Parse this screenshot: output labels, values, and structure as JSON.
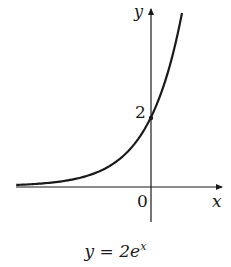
{
  "chart_data": {
    "type": "line",
    "title": "",
    "caption": "y = 2e^x",
    "function": "y = 2e^x",
    "xlabel": "x",
    "ylabel": "y",
    "origin_label": "0",
    "y_tick_labels": [
      "2"
    ],
    "annotations": [
      {
        "point": [
          0,
          2
        ],
        "label": "2",
        "marker": "dot"
      }
    ],
    "xlim": [
      -4.0,
      2.1
    ],
    "ylim": [
      -1.0,
      5.2
    ],
    "grid": false,
    "legend": null,
    "series": [
      {
        "name": "y = 2e^x",
        "x": [
          -4.0,
          -3.5,
          -3.0,
          -2.5,
          -2.0,
          -1.5,
          -1.0,
          -0.5,
          0.0,
          0.25,
          0.5,
          0.75,
          0.92
        ],
        "values": [
          0.04,
          0.06,
          0.1,
          0.16,
          0.27,
          0.45,
          0.74,
          1.21,
          2.0,
          2.57,
          3.3,
          4.23,
          5.02
        ]
      }
    ]
  },
  "labels": {
    "y_axis": "y",
    "x_axis": "x",
    "origin": "0",
    "y_tick": "2",
    "caption_base": "y = 2e",
    "caption_exp": "x"
  },
  "colors": {
    "ink": "#1a1a1a",
    "background": "#ffffff"
  }
}
